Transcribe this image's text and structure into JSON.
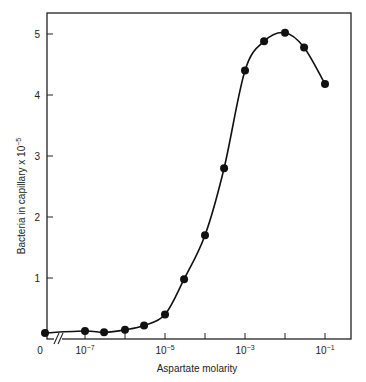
{
  "chart_data": {
    "type": "line",
    "title": "",
    "xlabel": "Aspartate molarity",
    "ylabel": "Bacteria in capillary x 10^-5",
    "ylabel_base": "Bacteria in capillary x 10",
    "ylabel_exp": "-5",
    "x_scale": "log (with break after 0)",
    "ylim": [
      0,
      5.3
    ],
    "grid": false,
    "legend": null,
    "x_tick_labels": [
      {
        "label": "0",
        "base": "0",
        "exp": ""
      },
      {
        "label": "10^-7",
        "base": "10",
        "exp": "-7"
      },
      {
        "label": "10^-5",
        "base": "10",
        "exp": "-5"
      },
      {
        "label": "10^-3",
        "base": "10",
        "exp": "-3"
      },
      {
        "label": "10^-1",
        "base": "10",
        "exp": "-1"
      }
    ],
    "y_tick_labels": [
      "1",
      "2",
      "3",
      "4",
      "5"
    ],
    "series": [
      {
        "name": "Bacteria in capillary",
        "x": [
          0,
          1e-07,
          3e-07,
          1e-06,
          3e-06,
          1e-05,
          3e-05,
          0.0001,
          0.0003,
          0.001,
          0.003,
          0.01,
          0.03,
          0.1
        ],
        "values": [
          0.1,
          0.13,
          0.11,
          0.15,
          0.22,
          0.4,
          0.98,
          1.7,
          2.8,
          4.4,
          4.88,
          5.02,
          4.78,
          4.18
        ]
      }
    ]
  }
}
